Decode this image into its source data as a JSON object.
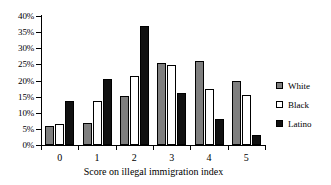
{
  "chart_data": {
    "type": "bar",
    "title": "",
    "subtitle": "",
    "xlabel": "Score on illegal immigration index",
    "ylabel": "",
    "categories": [
      "0",
      "1",
      "2",
      "3",
      "4",
      "5"
    ],
    "ylim": [
      0,
      40
    ],
    "ytick_values": [
      0,
      5,
      10,
      15,
      20,
      25,
      30,
      35,
      40
    ],
    "ytick_labels": [
      "0%",
      "5%",
      "10%",
      "15%",
      "20%",
      "25%",
      "30%",
      "35%",
      "40%"
    ],
    "yaxis_unit": "%",
    "grid": false,
    "legend_position": "right",
    "series": [
      {
        "name": "White",
        "color": "#7f7f7f",
        "values": [
          5.8,
          6.8,
          15.2,
          25.5,
          26.0,
          19.8
        ]
      },
      {
        "name": "Black",
        "color": "#ffffff",
        "values": [
          6.5,
          13.5,
          21.3,
          24.8,
          17.5,
          15.6
        ]
      },
      {
        "name": "Latino",
        "color": "#111111",
        "values": [
          13.5,
          20.5,
          37.0,
          16.0,
          8.0,
          3.0
        ]
      }
    ]
  }
}
